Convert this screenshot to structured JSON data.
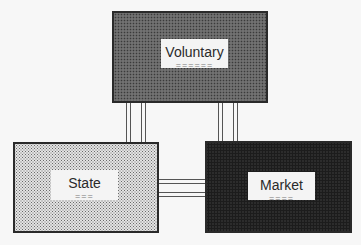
{
  "diagram": {
    "nodes": [
      {
        "id": "voluntary",
        "label": "Voluntary",
        "underline": "======",
        "shade": "medium"
      },
      {
        "id": "state",
        "label": "State",
        "underline": "===",
        "shade": "light"
      },
      {
        "id": "market",
        "label": "Market",
        "underline": "====",
        "shade": "dark"
      }
    ],
    "edges": [
      {
        "from": "voluntary",
        "to": "state",
        "style": "double-line"
      },
      {
        "from": "voluntary",
        "to": "market",
        "style": "double-line"
      },
      {
        "from": "state",
        "to": "market",
        "style": "double-line"
      }
    ]
  }
}
